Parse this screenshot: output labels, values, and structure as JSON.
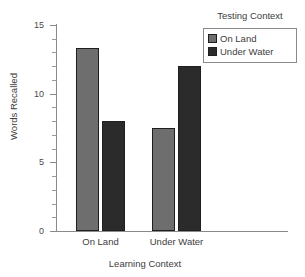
{
  "chart_data": {
    "type": "bar",
    "title": "",
    "xlabel": "Learning Context",
    "ylabel": "Words Recalled",
    "categories": [
      "On Land",
      "Under Water"
    ],
    "series": [
      {
        "name": "On Land",
        "values": [
          13.3,
          7.5
        ],
        "color": "#6e6e6e"
      },
      {
        "name": "Under Water",
        "values": [
          8.0,
          12.0
        ],
        "color": "#2b2b2b"
      }
    ],
    "ylim": [
      0,
      15
    ],
    "yticks": [
      0,
      5,
      10,
      15
    ],
    "ytick_labels": [
      "0",
      "5",
      "10",
      "15"
    ],
    "yminor_step": 1,
    "grid": false,
    "legend": {
      "title": "Testing Context",
      "position": "top-right",
      "entries": [
        {
          "label": "On Land",
          "color": "#6e6e6e"
        },
        {
          "label": "Under Water",
          "color": "#2b2b2b"
        }
      ]
    }
  },
  "axis": {
    "y_title": "Words Recalled",
    "x_title": "Learning Context",
    "y_labels": [
      "15",
      "10",
      "5",
      "0"
    ],
    "x_labels": [
      "On Land",
      "Under Water"
    ]
  },
  "legend": {
    "title": "Testing Context",
    "item0_label": "On Land",
    "item1_label": "Under Water"
  },
  "colors": {
    "on_land": "#6e6e6e",
    "under_water": "#2b2b2b",
    "axis": "#8a8a8a",
    "text": "#3d3d3d",
    "background": "#ffffff"
  }
}
